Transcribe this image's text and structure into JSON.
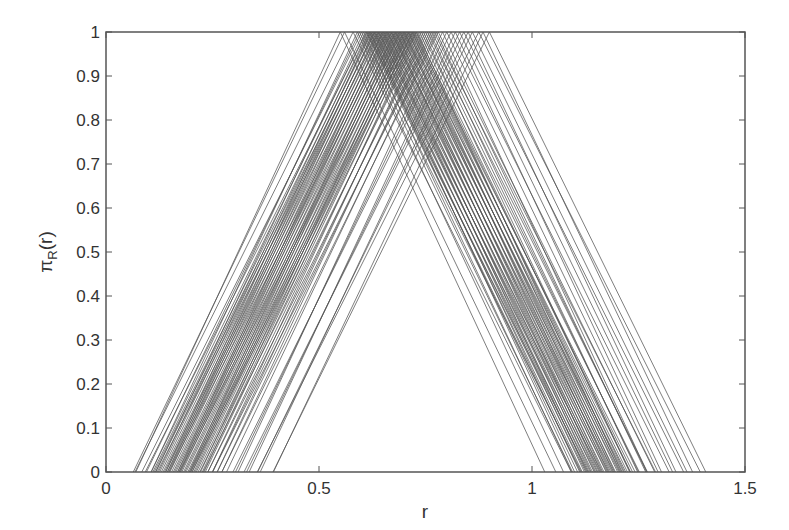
{
  "chart_data": {
    "type": "line",
    "title": "",
    "xlabel": "r",
    "ylabel": "π_R(r)",
    "ylabel_main": "π",
    "ylabel_sub": "R",
    "ylabel_tail": "(r)",
    "xlim": [
      0,
      1.5
    ],
    "ylim": [
      0,
      1
    ],
    "grid": false,
    "legend": null,
    "xticks": [
      0,
      0.5,
      1,
      1.5
    ],
    "xtick_labels": [
      "0",
      "0.5",
      "1",
      "1.5"
    ],
    "yticks": [
      0,
      0.1,
      0.2,
      0.3,
      0.4,
      0.5,
      0.6,
      0.7,
      0.8,
      0.9,
      1
    ],
    "ytick_labels": [
      "0",
      "0.1",
      "0.2",
      "0.3",
      "0.4",
      "0.5",
      "0.6",
      "0.7",
      "0.8",
      "0.9",
      "1"
    ],
    "line_color": "#555555",
    "half_width": 0.5,
    "series_peaks": [
      0.55,
      0.56,
      0.58,
      0.59,
      0.595,
      0.6,
      0.605,
      0.61,
      0.612,
      0.615,
      0.618,
      0.62,
      0.622,
      0.625,
      0.628,
      0.63,
      0.632,
      0.635,
      0.638,
      0.64,
      0.642,
      0.645,
      0.648,
      0.65,
      0.652,
      0.655,
      0.658,
      0.66,
      0.662,
      0.665,
      0.668,
      0.67,
      0.672,
      0.675,
      0.678,
      0.68,
      0.682,
      0.685,
      0.688,
      0.69,
      0.692,
      0.695,
      0.698,
      0.7,
      0.702,
      0.705,
      0.708,
      0.71,
      0.712,
      0.715,
      0.718,
      0.72,
      0.722,
      0.725,
      0.728,
      0.73,
      0.735,
      0.74,
      0.745,
      0.75,
      0.755,
      0.76,
      0.765,
      0.77,
      0.775,
      0.78,
      0.79,
      0.8,
      0.81,
      0.82,
      0.83,
      0.84,
      0.85,
      0.86,
      0.875,
      0.885,
      0.9
    ]
  }
}
